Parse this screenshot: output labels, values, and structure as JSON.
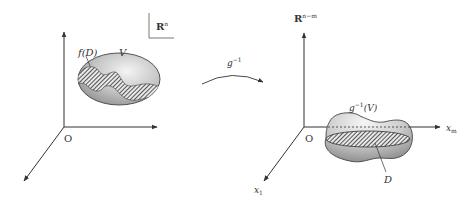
{
  "figure": {
    "left_panel": {
      "space_label": "R",
      "space_exponent": "n",
      "origin_label": "O",
      "set_V_label": "V",
      "set_fD_label": "f(D)"
    },
    "mapping": {
      "label": "g",
      "exponent": "−1"
    },
    "right_panel": {
      "space_label": "R",
      "space_exponent": "n−m",
      "origin_label": "O",
      "axis_xm_label": "x",
      "axis_xm_sub": "m",
      "axis_x1_label": "x",
      "axis_x1_sub": "1",
      "set_label_g": "g",
      "set_label_exp": "−1",
      "set_label_arg": "(V)",
      "set_D_label": "D"
    },
    "colors": {
      "axis": "#333333",
      "fill_light": "#f2f2f2",
      "fill_dark": "#8a8a8a",
      "hatch": "#333333"
    }
  }
}
